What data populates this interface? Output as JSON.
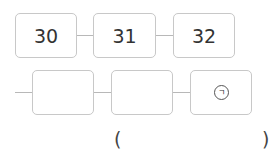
{
  "sequence": {
    "row1": [
      {
        "value": "30"
      },
      {
        "value": "31"
      },
      {
        "value": "32"
      }
    ],
    "row2": [
      {
        "value": ""
      },
      {
        "value": ""
      },
      {
        "value": "ㄱ",
        "marker": "circled-giyeok"
      }
    ]
  },
  "answer": {
    "open_paren": "(",
    "close_paren": ")",
    "value": ""
  }
}
